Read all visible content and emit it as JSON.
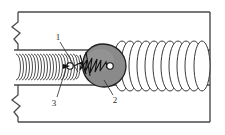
{
  "figure": {
    "background_color": "#ffffff",
    "stroke_color": "#2b2b2b",
    "outer_wall_color": "#555555",
    "channel_line_color": "#555555",
    "blob_fill_color": "#8a8a8a",
    "blob_highlight_color": "#9e9e9e",
    "coil_fill_color": "#ffffff"
  },
  "callouts": [
    {
      "id": "callout-1",
      "label": "1",
      "x": 58,
      "y": 38,
      "leader_to_x": 86,
      "leader_to_y": 60
    },
    {
      "id": "callout-2",
      "label": "2",
      "x": 115,
      "y": 100,
      "leader_to_x": 106,
      "leader_to_y": 80
    },
    {
      "id": "callout-3",
      "label": "3",
      "x": 54,
      "y": 103,
      "leader_to_x": 66,
      "leader_to_y": 62
    }
  ],
  "elements": {
    "outer_frame": "outer-conduit-wall",
    "break_symbol_top": "break-mark-top-left",
    "break_symbol_bottom": "break-mark-bottom-left",
    "inner_channel": "inner-channel-walls",
    "left_spring": "tight-coil-spring-left",
    "center_blob": "teardrop-obstruction",
    "blob_internal_spring": "jagged-spring-inside-blob",
    "right_coils": "large-helical-coils-right"
  },
  "geometry": {
    "outer_rect": {
      "x": 14,
      "y": 12,
      "w": 196,
      "h": 110
    },
    "channel_top_y": 50,
    "channel_bottom_y": 85,
    "channel_start_x": 14,
    "channel_end_x": 210,
    "left_spring": {
      "start_x": 16,
      "end_x": 78,
      "turns": 22,
      "ry": 13
    },
    "right_coils": {
      "start_x": 116,
      "end_x": 208,
      "turns": 12,
      "ry": 25
    },
    "blob": {
      "cx": 103,
      "cy": 65,
      "rx": 22,
      "ry": 21
    }
  }
}
